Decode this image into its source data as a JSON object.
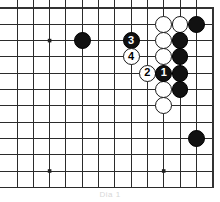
{
  "figure": {
    "caption": "Dia 1",
    "board": {
      "origin_x": 17,
      "origin_y": 8,
      "spacing": 16.3,
      "cols": 12,
      "rows": 11,
      "line_color": "#2b2b2b",
      "border_color": "#333333",
      "background": "#ffffff",
      "star_points": [
        {
          "col": 2,
          "row": 2
        },
        {
          "col": 2,
          "row": 10
        },
        {
          "col": 9,
          "row": 10
        }
      ]
    },
    "stones": [
      {
        "id": "w-c9-r1",
        "color": "white",
        "col": 9,
        "row": 1,
        "label": ""
      },
      {
        "id": "w-c10-r1",
        "color": "white",
        "col": 10,
        "row": 1,
        "label": ""
      },
      {
        "id": "b-c11-r1",
        "color": "black",
        "col": 11,
        "row": 1,
        "label": ""
      },
      {
        "id": "w-c9-r2",
        "color": "white",
        "col": 9,
        "row": 2,
        "label": ""
      },
      {
        "id": "b-c10-r2",
        "color": "black",
        "col": 10,
        "row": 2,
        "label": ""
      },
      {
        "id": "w-c9-r3",
        "color": "white",
        "col": 9,
        "row": 3,
        "label": ""
      },
      {
        "id": "b-c10-r3",
        "color": "black",
        "col": 10,
        "row": 3,
        "label": ""
      },
      {
        "id": "b-c10-r4",
        "color": "black",
        "col": 10,
        "row": 4,
        "label": ""
      },
      {
        "id": "w-c9-r5",
        "color": "white",
        "col": 9,
        "row": 5,
        "label": ""
      },
      {
        "id": "b-c10-r5",
        "color": "black",
        "col": 10,
        "row": 5,
        "label": ""
      },
      {
        "id": "w-c9-r6",
        "color": "white",
        "col": 9,
        "row": 6,
        "label": ""
      },
      {
        "id": "b-c4-r2",
        "color": "black",
        "col": 4,
        "row": 2,
        "label": ""
      },
      {
        "id": "b-c11-r8",
        "color": "black",
        "col": 11,
        "row": 8,
        "label": ""
      },
      {
        "id": "move-3",
        "color": "black",
        "col": 7,
        "row": 2,
        "label": "3"
      },
      {
        "id": "move-4",
        "color": "white",
        "col": 7,
        "row": 3,
        "label": "4"
      },
      {
        "id": "move-2",
        "color": "white",
        "col": 8,
        "row": 4,
        "label": "2"
      },
      {
        "id": "move-1",
        "color": "black",
        "col": 9,
        "row": 4,
        "label": "1"
      }
    ],
    "move_sequence": [
      {
        "number": "1",
        "color": "black"
      },
      {
        "number": "2",
        "color": "white"
      },
      {
        "number": "3",
        "color": "black"
      },
      {
        "number": "4",
        "color": "white"
      }
    ]
  }
}
